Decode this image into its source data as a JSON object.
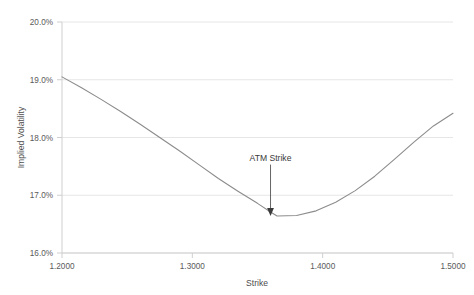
{
  "chart_data": {
    "type": "line",
    "title": "",
    "subtitle": "",
    "xlabel": "Strike",
    "ylabel": "Implied Volatility",
    "xlim": [
      1.2,
      1.5
    ],
    "ylim": [
      0.16,
      0.2
    ],
    "grid": "horizontal",
    "legend": "none",
    "x_tick_labels": [
      "1.2000",
      "1.3000",
      "1.4000",
      "1.5000"
    ],
    "x_tick_values": [
      1.2,
      1.3,
      1.4,
      1.5
    ],
    "y_tick_labels": [
      "16.0%",
      "17.0%",
      "18.0%",
      "19.0%",
      "20.0%"
    ],
    "y_tick_values": [
      0.16,
      0.17,
      0.18,
      0.19,
      0.2
    ],
    "series": [
      {
        "name": "Implied Volatility Smile",
        "color": "#8c8c8c",
        "x": [
          1.2,
          1.215,
          1.23,
          1.245,
          1.26,
          1.275,
          1.29,
          1.305,
          1.32,
          1.335,
          1.35,
          1.36,
          1.365,
          1.38,
          1.395,
          1.41,
          1.425,
          1.44,
          1.455,
          1.47,
          1.485,
          1.5
        ],
        "y": [
          0.1905,
          0.1886,
          0.1866,
          0.1845,
          0.1823,
          0.18,
          0.1777,
          0.1753,
          0.1729,
          0.1707,
          0.1686,
          0.1671,
          0.1664,
          0.1665,
          0.1673,
          0.1688,
          0.1708,
          0.1733,
          0.1762,
          0.1792,
          0.182,
          0.1842
        ]
      }
    ],
    "annotations": [
      {
        "text": "ATM Strike",
        "x": 1.36,
        "y": 0.1664,
        "label_x": 1.36,
        "label_y": 0.176,
        "arrow": "down"
      }
    ],
    "colors": {
      "line": "#8c8c8c",
      "gridline": "#e8e8e8",
      "axis": "#d0d0d0",
      "tick_text": "#5a5a5a",
      "axis_title": "#4d4d4d",
      "annotation": "#3a3a3a",
      "background": "#ffffff"
    }
  },
  "axes": {
    "y_title": "Implied Volatility",
    "x_title": "Strike",
    "y_ticks": [
      "20.0%",
      "19.0%",
      "18.0%",
      "17.0%",
      "16.0%"
    ],
    "x_ticks": [
      "1.2000",
      "1.3000",
      "1.4000",
      "1.5000"
    ]
  },
  "annotation": {
    "atm_label": "ATM Strike"
  }
}
